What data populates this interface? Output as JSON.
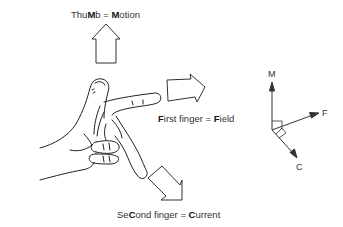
{
  "labels": {
    "thumb": {
      "parts": [
        "Thu",
        "M",
        "b = ",
        "M",
        "otion"
      ]
    },
    "first": {
      "parts": [
        "",
        "F",
        "irst finger = ",
        "F",
        "ield"
      ]
    },
    "second": {
      "parts": [
        "Se",
        "C",
        "ond finger = ",
        "C",
        "urrent"
      ]
    }
  },
  "axes": {
    "m_label": "M",
    "f_label": "F",
    "c_label": "C"
  },
  "colors": {
    "stroke": "#333333",
    "text": "#333333",
    "background": "#ffffff"
  }
}
